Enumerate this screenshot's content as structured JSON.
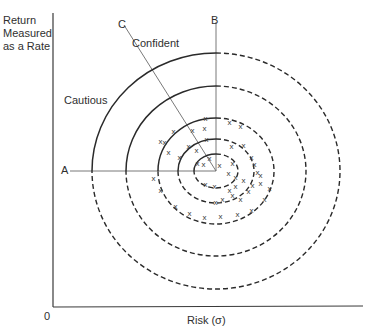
{
  "figure": {
    "y_axis_label": [
      "Return",
      "Measured",
      "as a Rate"
    ],
    "x_axis_label": "Risk (σ)",
    "origin_label": "0",
    "region_labels": {
      "cautious": "Cautious",
      "confident": "Confident"
    },
    "line_labels": {
      "a": "A",
      "b": "B",
      "c": "C"
    },
    "center": [
      216,
      171
    ],
    "rings": [
      {
        "rx": 124,
        "ry": 118
      },
      {
        "rx": 90,
        "ry": 85
      },
      {
        "rx": 58,
        "ry": 53
      },
      {
        "rx": 38,
        "ry": 32
      },
      {
        "rx": 22,
        "ry": 17
      }
    ],
    "ring_style": "solid upper-left quadrant, dashed elsewhere",
    "marker": "x",
    "colors": {
      "ink": "#2a2a2a",
      "thin_line": "#6a6a6a",
      "background": "#ffffff"
    }
  }
}
